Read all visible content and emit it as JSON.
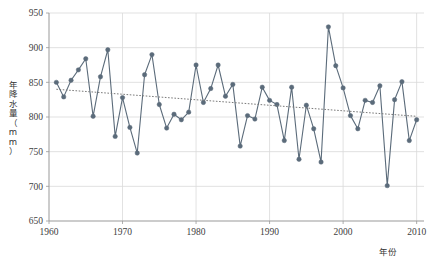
{
  "chart_data": {
    "type": "line",
    "title": "",
    "subtitle": "",
    "xlabel": "年份",
    "ylabel": "年降水量（mm）",
    "xlim": [
      1960,
      2011
    ],
    "ylim": [
      650,
      950
    ],
    "xticks": [
      1960,
      1970,
      1980,
      1990,
      2000,
      2010
    ],
    "yticks": [
      650,
      700,
      750,
      800,
      850,
      900,
      950
    ],
    "grid": true,
    "legend": "none",
    "series": [
      {
        "name": "年降水量",
        "marker": "circle",
        "color": "#5b6b7a",
        "x": [
          1961,
          1962,
          1963,
          1964,
          1965,
          1966,
          1967,
          1968,
          1969,
          1970,
          1971,
          1972,
          1973,
          1974,
          1975,
          1976,
          1977,
          1978,
          1979,
          1980,
          1981,
          1982,
          1983,
          1984,
          1985,
          1986,
          1987,
          1988,
          1989,
          1990,
          1991,
          1992,
          1993,
          1994,
          1995,
          1996,
          1997,
          1998,
          1999,
          2000,
          2001,
          2002,
          2003,
          2004,
          2005,
          2006,
          2007,
          2008,
          2009,
          2010
        ],
        "values": [
          850,
          829,
          853,
          868,
          884,
          801,
          858,
          897,
          772,
          828,
          785,
          748,
          861,
          890,
          818,
          784,
          804,
          796,
          807,
          875,
          821,
          841,
          875,
          830,
          847,
          758,
          802,
          797,
          843,
          824,
          818,
          766,
          843,
          739,
          817,
          783,
          735,
          930,
          874,
          842,
          802,
          783,
          824,
          821,
          845,
          701,
          825,
          851,
          766,
          796
        ]
      },
      {
        "name": "线性趋势线",
        "type": "trendline",
        "style": "dotted",
        "color": "#7a7a7a",
        "x": [
          1961,
          2010
        ],
        "values": [
          840,
          801
        ]
      }
    ]
  }
}
